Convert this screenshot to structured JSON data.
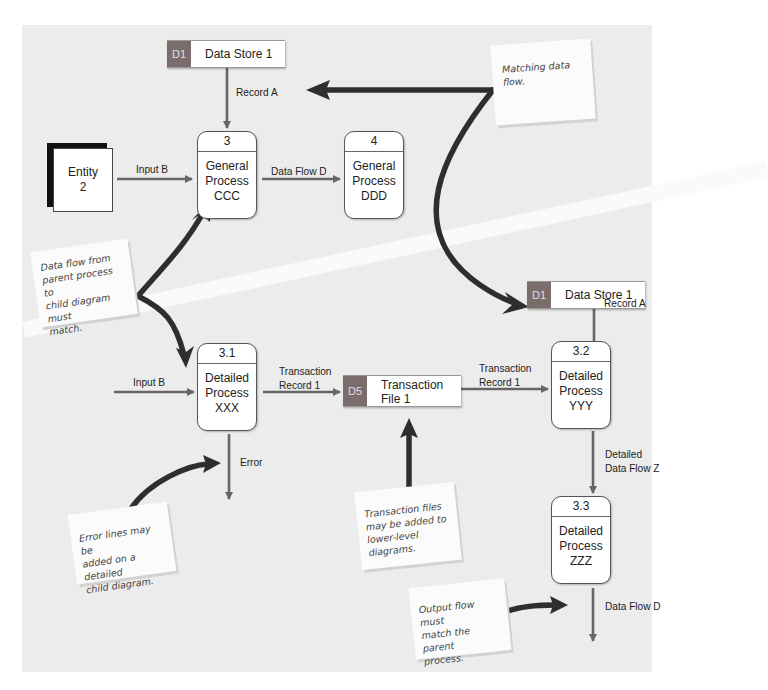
{
  "colors": {
    "panel_bg": "#ececec",
    "store_id_bg": "#7c6d6d",
    "flow_line": "#666666",
    "callout_arrow": "#2e2e2e"
  },
  "top_diagram": {
    "data_store": {
      "id": "D1",
      "name": "Data Store 1"
    },
    "record_flow_label": "Record A",
    "entity": {
      "name": "Entity\n2"
    },
    "input_flow_label": "Input B",
    "process_3": {
      "id": "3",
      "name": "General\nProcess\nCCC"
    },
    "data_flow_label": "Data Flow D",
    "process_4": {
      "id": "4",
      "name": "General\nProcess\nDDD"
    }
  },
  "child_diagram": {
    "data_store": {
      "id": "D1",
      "name": "Data Store 1"
    },
    "record_flow_label": "Record A",
    "input_flow_label": "Input B",
    "process_3_1": {
      "id": "3.1",
      "name": "Detailed\nProcess\nXXX"
    },
    "transaction_flow_left_label": "Transaction\nRecord 1",
    "transaction_store": {
      "id": "D5",
      "name": "Transaction\nFile 1"
    },
    "transaction_flow_right_label": "Transaction\nRecord 1",
    "process_3_2": {
      "id": "3.2",
      "name": "Detailed\nProcess\nYYY"
    },
    "detailed_flow_label": "Detailed\nData Flow Z",
    "process_3_3": {
      "id": "3.3",
      "name": "Detailed\nProcess\nZZZ"
    },
    "error_flow_label": "Error",
    "output_flow_label": "Data Flow D"
  },
  "notes": {
    "matching": "Matching data flow.",
    "parent_child": "Data flow from\nparent process to\nchild diagram must\n  match.",
    "error_lines": "Error lines may be\nadded on a detailed\nchild diagram.",
    "transaction_files": "Transaction files\nmay be added to\nlower-level diagrams.",
    "output_flow": "Output flow must\nmatch the parent\nprocess."
  }
}
